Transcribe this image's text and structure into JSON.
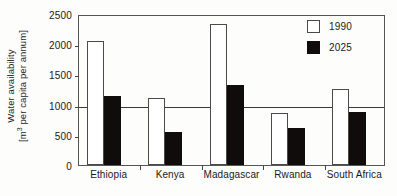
{
  "chart_data": {
    "type": "bar",
    "title": "",
    "xlabel": "",
    "ylabel": "Water availability [m³ per capita per annum]",
    "ylabel_line1": "Water availability",
    "ylabel_line2_prefix": "[m",
    "ylabel_line2_exponent": "3",
    "ylabel_line2_suffix": " per capita per annum]",
    "categories": [
      "Ethiopia",
      "Kenya",
      "Madagascar",
      "Rwanda",
      "South Africa"
    ],
    "series": [
      {
        "name": "1990",
        "color": "#ffffff",
        "edge_color": "#4a4a4a",
        "values": [
          2050,
          1110,
          2330,
          860,
          1260
        ]
      },
      {
        "name": "2025",
        "color": "#100c0c",
        "edge_color": "#100c0c",
        "values": [
          1140,
          550,
          1320,
          610,
          880
        ]
      }
    ],
    "ylim": [
      0,
      2500
    ],
    "yticks": [
      0,
      500,
      1000,
      1500,
      2000,
      2500
    ],
    "ytick_labels": [
      "0",
      "500",
      "1000",
      "1500",
      "2000",
      "2500"
    ],
    "grid": false,
    "reference_line": {
      "value": 1000,
      "color": "#3a3a3a"
    },
    "legend": {
      "position": "top-right",
      "entries": [
        "1990",
        "2025"
      ]
    }
  }
}
